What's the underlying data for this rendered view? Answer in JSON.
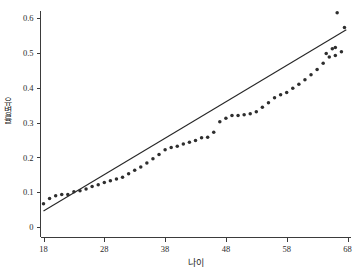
{
  "chart_data": {
    "type": "scatter",
    "title": "",
    "xlabel": "나이",
    "ylabel": "유병률",
    "xlim": [
      16.5,
      69.5
    ],
    "ylim": [
      -0.012,
      0.645
    ],
    "grid": false,
    "legend": null,
    "xticks": [
      18,
      28,
      38,
      48,
      58,
      68
    ],
    "xticklabels": [
      "18",
      "28",
      "38",
      "48",
      "58",
      "68"
    ],
    "yticks": [
      0,
      0.1,
      0.2,
      0.3,
      0.4,
      0.5,
      0.6
    ],
    "yticklabels": [
      "0",
      "0.1",
      "0.2",
      "0.3",
      "0.4",
      "0.5",
      "0.6"
    ],
    "marker_color": "#2e2e2e",
    "line_color": "#262626",
    "axis_color": "#3b3b3b",
    "series": [
      {
        "name": "관측값",
        "type": "scatter",
        "x": [
          18.0,
          19.0,
          20.0,
          21.0,
          22.0,
          23.0,
          24.0,
          25.0,
          26.0,
          27.0,
          28.0,
          29.0,
          30.0,
          31.0,
          32.0,
          33.0,
          34.0,
          35.0,
          36.0,
          37.0,
          38.0,
          39.0,
          40.0,
          41.0,
          42.0,
          43.0,
          44.0,
          45.0,
          46.0,
          47.0,
          48.0,
          49.0,
          50.0,
          51.0,
          52.0,
          53.0,
          54.0,
          55.0,
          56.0,
          57.0,
          58.0,
          59.0,
          60.0,
          61.0,
          62.0,
          63.0,
          64.0,
          65.0,
          66.0,
          67.0
        ],
        "y": [
          0.067,
          0.082,
          0.09,
          0.093,
          0.093,
          0.101,
          0.104,
          0.109,
          0.116,
          0.121,
          0.128,
          0.133,
          0.138,
          0.143,
          0.153,
          0.163,
          0.172,
          0.184,
          0.196,
          0.208,
          0.222,
          0.228,
          0.232,
          0.238,
          0.243,
          0.248,
          0.256,
          0.258,
          0.272,
          0.302,
          0.312,
          0.32,
          0.32,
          0.322,
          0.325,
          0.331,
          0.344,
          0.357,
          0.371,
          0.38,
          0.386,
          0.398,
          0.41,
          0.423,
          0.437,
          0.452,
          0.47,
          0.488,
          0.492,
          0.503
        ],
        "extra_x": [
          64.5,
          65.5,
          66.0,
          67.5,
          66.3
        ],
        "extra_y": [
          0.498,
          0.512,
          0.515,
          0.573,
          0.615
        ]
      },
      {
        "name": "회귀선",
        "type": "line",
        "x": [
          18.0,
          67.8
        ],
        "y": [
          0.046,
          0.566
        ]
      }
    ],
    "annotations": []
  }
}
